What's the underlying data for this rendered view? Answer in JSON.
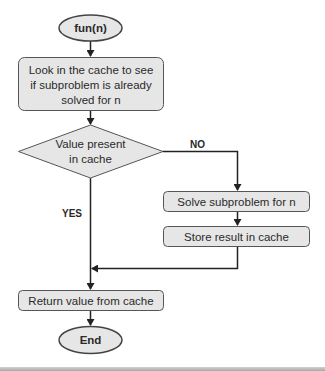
{
  "diagram": {
    "type": "flowchart",
    "colors": {
      "node_fill": "#e6e6e6",
      "node_stroke": "#555555",
      "edge": "#222222",
      "text": "#2a2a2a"
    },
    "nodes": {
      "start": {
        "shape": "ellipse",
        "label": "fun(n)"
      },
      "lookup": {
        "shape": "rounded-rect",
        "lines": [
          "Look in the cache to see",
          "if subproblem is already",
          "solved for n"
        ]
      },
      "decision": {
        "shape": "diamond",
        "lines": [
          "Value present",
          "in cache"
        ]
      },
      "solve": {
        "shape": "rounded-rect",
        "label": "Solve subproblem for n"
      },
      "store": {
        "shape": "rounded-rect",
        "label": "Store result in cache"
      },
      "return": {
        "shape": "rounded-rect",
        "label": "Return value from cache"
      },
      "end": {
        "shape": "ellipse",
        "label": "End"
      }
    },
    "edges": {
      "no_label": "NO",
      "yes_label": "YES"
    }
  }
}
